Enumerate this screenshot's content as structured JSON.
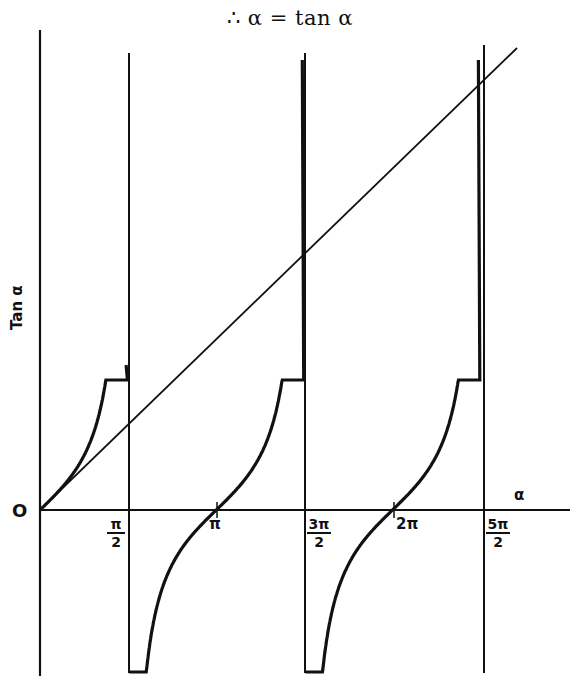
{
  "title": "∴  α = tan α",
  "chart_data": {
    "type": "line",
    "title": "∴ α = tan α",
    "xlabel": "α",
    "ylabel": "Tan α",
    "origin_label": "O",
    "x_ticks": [
      {
        "value": 1.5708,
        "label_num": "π",
        "label_den": "2",
        "label": "π/2"
      },
      {
        "value": 3.1416,
        "label": "π"
      },
      {
        "value": 4.7124,
        "label_num": "3π",
        "label_den": "2",
        "label": "3π/2"
      },
      {
        "value": 6.2832,
        "label": "2π"
      },
      {
        "value": 7.854,
        "label_num": "5π",
        "label_den": "2",
        "label": "5π/2"
      }
    ],
    "asymptotes_x": [
      1.5708,
      4.7124,
      7.854
    ],
    "series": [
      {
        "name": "tan α",
        "kind": "curve",
        "branches": [
          [
            0,
            1.56
          ],
          [
            1.59,
            4.7
          ],
          [
            4.73,
            7.84
          ]
        ]
      },
      {
        "name": "α",
        "kind": "line",
        "x": [
          0,
          8.5
        ],
        "y": [
          0,
          8.5
        ]
      }
    ],
    "intersections_alpha": [
      0,
      4.4934,
      7.7253
    ],
    "xlim": [
      0,
      9.5
    ],
    "ylim": [
      -3.3,
      8.5
    ],
    "grid": false,
    "legend": "none"
  },
  "labels": {
    "origin": "O",
    "x_axis": "α",
    "y_axis": "Tan α",
    "pi_half_num": "π",
    "pi_half_den": "2",
    "pi": "π",
    "three_pi_half_num": "3π",
    "three_pi_half_den": "2",
    "two_pi": "2π",
    "five_pi_half_num": "5π",
    "five_pi_half_den": "2"
  }
}
